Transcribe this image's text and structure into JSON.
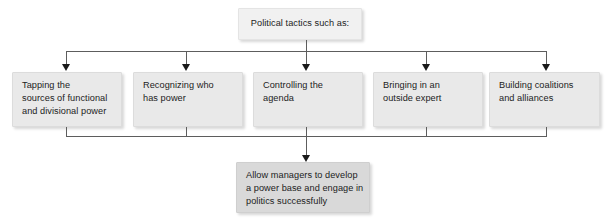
{
  "diagram": {
    "title_box": {
      "text": "Political tactics such as:"
    },
    "tactics": [
      {
        "name": "tapping-sources",
        "lines": [
          "Tapping the",
          "sources of functional",
          "and divisional power"
        ]
      },
      {
        "name": "recognizing-power",
        "lines": [
          "Recognizing who",
          "has power"
        ]
      },
      {
        "name": "controlling-agenda",
        "lines": [
          "Controlling the",
          "agenda"
        ]
      },
      {
        "name": "outside-expert",
        "lines": [
          "Bringing in an",
          "outside expert"
        ]
      },
      {
        "name": "building-coalitions",
        "lines": [
          "Building coalitions",
          "and alliances"
        ]
      }
    ],
    "outcome_box": {
      "lines": [
        "Allow managers to develop",
        "a power base and engage in",
        "politics successfully"
      ]
    },
    "colors": {
      "box_fill": "#e9e9e9",
      "top_box_fill": "#f1f1f1",
      "outcome_box_fill": "#d9d9d9",
      "connector": "#5d5d5d",
      "arrow": "#1a1a1a",
      "text": "#1c1c1c",
      "background": "#ffffff"
    }
  }
}
